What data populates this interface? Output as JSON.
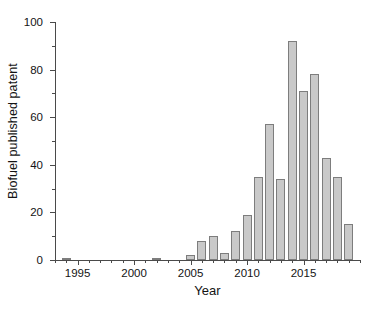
{
  "chart_data": {
    "type": "bar",
    "title": "",
    "xlabel": "Year",
    "ylabel": "Biofuel published patent",
    "xlim": [
      1993,
      2020
    ],
    "ylim": [
      0,
      100
    ],
    "grid": false,
    "legend": null,
    "x_ticks_major": [
      "1995",
      "2000",
      "2005",
      "2010",
      "2015"
    ],
    "y_ticks_major": [
      "0",
      "20",
      "40",
      "60",
      "80",
      "100"
    ],
    "y_ticks_minor": [
      10,
      30,
      50,
      70,
      90
    ],
    "categories": [
      "1994",
      "1995",
      "1996",
      "1997",
      "1998",
      "1999",
      "2000",
      "2001",
      "2002",
      "2003",
      "2004",
      "2005",
      "2006",
      "2007",
      "2008",
      "2009",
      "2010",
      "2011",
      "2012",
      "2013",
      "2014",
      "2015",
      "2016",
      "2017",
      "2018",
      "2019"
    ],
    "values": [
      1,
      0,
      0,
      0,
      0,
      0,
      0,
      0,
      1,
      0,
      0,
      2,
      8,
      10,
      3,
      12,
      19,
      35,
      57,
      34,
      92,
      71,
      78,
      43,
      35,
      15
    ],
    "bar_fill_color": "#c9c9c9",
    "bar_edge_color": "#7d7d7d",
    "axis_color": "#4a4a4a",
    "background_color": "#ffffff"
  }
}
